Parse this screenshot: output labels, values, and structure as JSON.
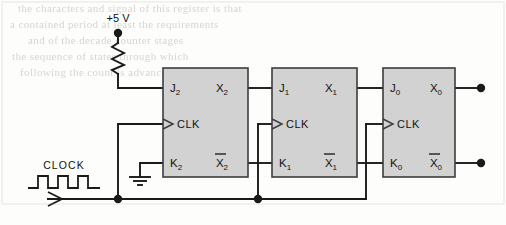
{
  "diagram": {
    "type": "digital-logic-schematic",
    "supply": {
      "label": "+5 V",
      "component": "pull-up-resistor",
      "feeds": "J2"
    },
    "ground": {
      "symbol": "earth-ground",
      "connects_to": "K2"
    },
    "clock": {
      "label": "CLOCK",
      "waveform": "square",
      "pulses": 3,
      "bus_name": "clock-bus",
      "junctions": 2
    },
    "flipflops": [
      {
        "name": "ff2",
        "stage": "most-significant",
        "inputs": {
          "j": "J",
          "j_sub": "2",
          "clk": "CLK",
          "k": "K",
          "k_sub": "2"
        },
        "outputs": {
          "q": "X",
          "q_sub": "2",
          "qbar": "X",
          "qbar_sub": "2"
        }
      },
      {
        "name": "ff1",
        "stage": "middle",
        "inputs": {
          "j": "J",
          "j_sub": "1",
          "clk": "CLK",
          "k": "K",
          "k_sub": "1"
        },
        "outputs": {
          "q": "X",
          "q_sub": "1",
          "qbar": "X",
          "qbar_sub": "1"
        }
      },
      {
        "name": "ff0",
        "stage": "least-significant",
        "inputs": {
          "j": "J",
          "j_sub": "0",
          "clk": "CLK",
          "k": "K",
          "k_sub": "0"
        },
        "outputs": {
          "q": "X",
          "q_sub": "0",
          "qbar": "X",
          "qbar_sub": "0"
        }
      }
    ],
    "terminals": [
      {
        "name": "out-x0",
        "signal": "X",
        "signal_sub": "0"
      },
      {
        "name": "out-x0-bar",
        "signal": "X",
        "signal_sub": "0"
      }
    ],
    "nets": [
      {
        "from": "X2",
        "to": "J1"
      },
      {
        "from": "X1",
        "to": "J0"
      },
      {
        "from": "X2bar",
        "to": "K1"
      },
      {
        "from": "X1bar",
        "to": "K0"
      },
      {
        "from": "CLOCK",
        "to": "CLK2, CLK1, CLK0"
      }
    ],
    "colors": {
      "wire": "#1a1a1a",
      "box_fill": "#d2d2d2",
      "box_stroke": "#3c3c3c",
      "background": "#fdfdfc",
      "ghost_text": "#787673"
    }
  },
  "ghost_text": {
    "line1": "the characters and signal of this register is that",
    "line2": "a contained period at least the requirements",
    "line3": "and of the decade counter stages",
    "line4": "the sequence of states through which",
    "line5": "following the count is advanced on each"
  }
}
